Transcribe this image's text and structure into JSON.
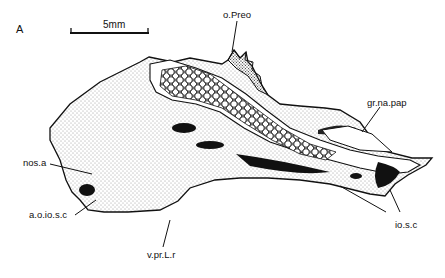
{
  "figure": {
    "panel_label": "A",
    "scale_bar": {
      "label": "5mm"
    },
    "labels": {
      "o_preo": "o.Preo",
      "gr_na_pap": "gr.na.pap",
      "nos_a": "nos.a",
      "a_o_io_s_c": "a.o.io.s.c",
      "v_pr_l_r": "v.pr.L.r",
      "io_s_c": "io.s.c"
    },
    "colors": {
      "ink": "#111111",
      "stipple": "#333333",
      "background": "#ffffff"
    }
  }
}
